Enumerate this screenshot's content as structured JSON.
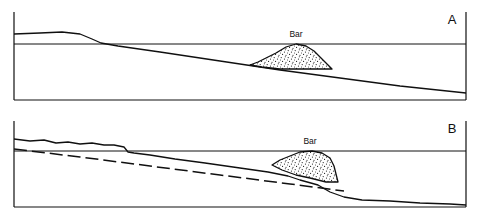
{
  "figure": {
    "type": "geologic-cross-section-diagram",
    "background_color": "#ffffff",
    "line_color": "#101010",
    "fill_color": "#ffffff",
    "stipple_color": "#101010",
    "width": 481,
    "height": 216
  },
  "panels": [
    {
      "id": "A",
      "label": "A",
      "label_x": 452,
      "label_y": 24,
      "frame": {
        "left_x": 14,
        "right_x": 466,
        "top_y": 12,
        "bottom_y": 100
      },
      "waterline": {
        "name": "water-surface",
        "y": 44,
        "x_start": 14,
        "x_end": 466
      },
      "profile": {
        "name": "sea-floor-profile",
        "description": "terrace with upper platform, break in slope, and gently dipping ramp",
        "points": "14,34 40,33 62,32 80,34 92,39 101,43 118,46 160,52 220,61 280,70 340,78 400,86 466,93"
      },
      "bar": {
        "name": "sediment-bar",
        "label": "Bar",
        "label_x": 296,
        "label_y": 37,
        "outline": "250,65 258,62 266,58 276,53 286,47 296,44 306,46 314,51 321,58 328,65 332,69 320,69 300,69 280,69 262,67",
        "base": "250,65 332,69"
      }
    },
    {
      "id": "B",
      "label": "B",
      "label_x": 452,
      "label_y": 133,
      "frame": {
        "left_x": 14,
        "right_x": 466,
        "top_y": 121,
        "bottom_y": 207
      },
      "waterline": {
        "name": "water-surface",
        "y": 151,
        "x_start": 14,
        "x_end": 466
      },
      "profile": {
        "name": "sea-floor-profile",
        "description": "irregular upper platform, slope break, ramp, bar, and steep drop-off to deep floor",
        "points": "14,139 30,141 44,140 56,143 68,142 80,144 92,143 104,145 114,145 124,147 128,152 134,153 150,155 175,159 205,163 240,168 268,172 288,176 300,180 318,185 330,192 344,197 362,200 390,201 420,203 450,204 466,205"
      },
      "dashed_line": {
        "name": "former-profile-dashed",
        "description": "dashed line indicating original or projected profile",
        "points": "14,149 80,157 150,166 220,175 290,184 344,191",
        "dash_pattern": "13,5"
      },
      "bar": {
        "name": "sediment-bar",
        "label": "Bar",
        "label_x": 310,
        "label_y": 144,
        "outline": "272,165 280,160 290,156 300,152 312,151 322,153 330,158 334,166 336,174 338,182 326,182 310,178 296,175 282,170",
        "base": "272,165 338,182"
      }
    }
  ],
  "annotations": {
    "bar_label_text": "Bar",
    "panel_a_label": "A",
    "panel_b_label": "B"
  }
}
